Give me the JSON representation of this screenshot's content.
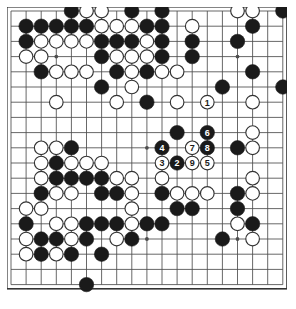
{
  "app": {
    "title": "Go Game Record Diagram",
    "description": "19x19 Go board position diagram with numbered move sequence 1-9"
  },
  "board": {
    "size": 19,
    "origin_x": 11,
    "origin_y": 11,
    "spacing_x": 15.1,
    "spacing_y": 15.2,
    "line_color": "#4d4d4d",
    "border_color": "#333333",
    "background_color": "#ffffff",
    "black_color": "#1a1a1a",
    "white_color": "#ffffff",
    "white_outline_color": "#333333",
    "stone_radius": 7.2,
    "star_points": [
      {
        "col": 3,
        "row": 3
      },
      {
        "col": 9,
        "row": 3
      },
      {
        "col": 15,
        "row": 3
      },
      {
        "col": 3,
        "row": 9
      },
      {
        "col": 9,
        "row": 9
      },
      {
        "col": 15,
        "row": 9
      },
      {
        "col": 3,
        "row": 15
      },
      {
        "col": 9,
        "row": 15
      },
      {
        "col": 15,
        "row": 15
      }
    ]
  },
  "stones": {
    "black": [
      {
        "col": 4,
        "row": 0
      },
      {
        "col": 8,
        "row": 0
      },
      {
        "col": 10,
        "row": 0
      },
      {
        "col": 18,
        "row": 0
      },
      {
        "col": 1,
        "row": 1
      },
      {
        "col": 2,
        "row": 1
      },
      {
        "col": 3,
        "row": 1
      },
      {
        "col": 4,
        "row": 1
      },
      {
        "col": 5,
        "row": 1
      },
      {
        "col": 9,
        "row": 1
      },
      {
        "col": 10,
        "row": 1
      },
      {
        "col": 16,
        "row": 1
      },
      {
        "col": 1,
        "row": 2
      },
      {
        "col": 6,
        "row": 2
      },
      {
        "col": 7,
        "row": 2
      },
      {
        "col": 8,
        "row": 2
      },
      {
        "col": 10,
        "row": 2
      },
      {
        "col": 12,
        "row": 2
      },
      {
        "col": 15,
        "row": 2
      },
      {
        "col": 6,
        "row": 3
      },
      {
        "col": 10,
        "row": 3
      },
      {
        "col": 12,
        "row": 3
      },
      {
        "col": 2,
        "row": 4
      },
      {
        "col": 7,
        "row": 4
      },
      {
        "col": 9,
        "row": 4
      },
      {
        "col": 16,
        "row": 4
      },
      {
        "col": 6,
        "row": 5
      },
      {
        "col": 14,
        "row": 5
      },
      {
        "col": 18,
        "row": 5
      },
      {
        "col": 9,
        "row": 6
      },
      {
        "col": 11,
        "row": 8
      },
      {
        "col": 13,
        "row": 8
      },
      {
        "col": 4,
        "row": 9
      },
      {
        "col": 13,
        "row": 9
      },
      {
        "col": 15,
        "row": 9
      },
      {
        "col": 3,
        "row": 10
      },
      {
        "col": 3,
        "row": 11
      },
      {
        "col": 4,
        "row": 11
      },
      {
        "col": 5,
        "row": 11
      },
      {
        "col": 6,
        "row": 11
      },
      {
        "col": 2,
        "row": 12
      },
      {
        "col": 6,
        "row": 12
      },
      {
        "col": 7,
        "row": 12
      },
      {
        "col": 10,
        "row": 12
      },
      {
        "col": 15,
        "row": 12
      },
      {
        "col": 11,
        "row": 13
      },
      {
        "col": 12,
        "row": 13
      },
      {
        "col": 15,
        "row": 13
      },
      {
        "col": 1,
        "row": 14
      },
      {
        "col": 5,
        "row": 14
      },
      {
        "col": 6,
        "row": 14
      },
      {
        "col": 7,
        "row": 14
      },
      {
        "col": 9,
        "row": 14
      },
      {
        "col": 10,
        "row": 14
      },
      {
        "col": 16,
        "row": 14
      },
      {
        "col": 2,
        "row": 15
      },
      {
        "col": 3,
        "row": 15
      },
      {
        "col": 5,
        "row": 15
      },
      {
        "col": 8,
        "row": 15
      },
      {
        "col": 14,
        "row": 15
      },
      {
        "col": 2,
        "row": 16
      },
      {
        "col": 4,
        "row": 16
      },
      {
        "col": 6,
        "row": 16
      },
      {
        "col": 5,
        "row": 18
      }
    ],
    "white": [
      {
        "col": 5,
        "row": 0
      },
      {
        "col": 6,
        "row": 0
      },
      {
        "col": 15,
        "row": 0
      },
      {
        "col": 16,
        "row": 0
      },
      {
        "col": 6,
        "row": 1
      },
      {
        "col": 7,
        "row": 1
      },
      {
        "col": 8,
        "row": 1
      },
      {
        "col": 12,
        "row": 1
      },
      {
        "col": 2,
        "row": 2
      },
      {
        "col": 3,
        "row": 2
      },
      {
        "col": 4,
        "row": 2
      },
      {
        "col": 5,
        "row": 2
      },
      {
        "col": 9,
        "row": 2
      },
      {
        "col": 1,
        "row": 3
      },
      {
        "col": 2,
        "row": 3
      },
      {
        "col": 7,
        "row": 3
      },
      {
        "col": 8,
        "row": 3
      },
      {
        "col": 9,
        "row": 3
      },
      {
        "col": 3,
        "row": 4
      },
      {
        "col": 4,
        "row": 4
      },
      {
        "col": 5,
        "row": 4
      },
      {
        "col": 8,
        "row": 4
      },
      {
        "col": 10,
        "row": 4
      },
      {
        "col": 11,
        "row": 4
      },
      {
        "col": 8,
        "row": 5
      },
      {
        "col": 3,
        "row": 6
      },
      {
        "col": 7,
        "row": 6
      },
      {
        "col": 11,
        "row": 6
      },
      {
        "col": 16,
        "row": 6
      },
      {
        "col": 16,
        "row": 8
      },
      {
        "col": 2,
        "row": 9
      },
      {
        "col": 3,
        "row": 9
      },
      {
        "col": 16,
        "row": 9
      },
      {
        "col": 2,
        "row": 10
      },
      {
        "col": 4,
        "row": 10
      },
      {
        "col": 5,
        "row": 10
      },
      {
        "col": 6,
        "row": 10
      },
      {
        "col": 2,
        "row": 11
      },
      {
        "col": 7,
        "row": 11
      },
      {
        "col": 8,
        "row": 11
      },
      {
        "col": 10,
        "row": 11
      },
      {
        "col": 16,
        "row": 11
      },
      {
        "col": 3,
        "row": 12
      },
      {
        "col": 4,
        "row": 12
      },
      {
        "col": 8,
        "row": 12
      },
      {
        "col": 11,
        "row": 12
      },
      {
        "col": 12,
        "row": 12
      },
      {
        "col": 13,
        "row": 12
      },
      {
        "col": 16,
        "row": 12
      },
      {
        "col": 1,
        "row": 13
      },
      {
        "col": 2,
        "row": 13
      },
      {
        "col": 8,
        "row": 13
      },
      {
        "col": 3,
        "row": 14
      },
      {
        "col": 4,
        "row": 14
      },
      {
        "col": 8,
        "row": 14
      },
      {
        "col": 15,
        "row": 14
      },
      {
        "col": 1,
        "row": 15
      },
      {
        "col": 4,
        "row": 15
      },
      {
        "col": 7,
        "row": 15
      },
      {
        "col": 16,
        "row": 15
      },
      {
        "col": 1,
        "row": 16
      },
      {
        "col": 3,
        "row": 16
      }
    ]
  },
  "move_sequence": [
    {
      "number": "1",
      "col": 13,
      "row": 6,
      "color": "white"
    },
    {
      "number": "2",
      "col": 11,
      "row": 10,
      "color": "black"
    },
    {
      "number": "3",
      "col": 10,
      "row": 10,
      "color": "white"
    },
    {
      "number": "4",
      "col": 10,
      "row": 9,
      "color": "black"
    },
    {
      "number": "5",
      "col": 13,
      "row": 10,
      "color": "white"
    },
    {
      "number": "6",
      "col": 13,
      "row": 8,
      "color": "black"
    },
    {
      "number": "7",
      "col": 12,
      "row": 9,
      "color": "white"
    },
    {
      "number": "8",
      "col": 13,
      "row": 9,
      "color": "black"
    },
    {
      "number": "9",
      "col": 12,
      "row": 10,
      "color": "white"
    }
  ],
  "legend": {
    "black_label": "Black",
    "white_label": "White",
    "move_label": "Move"
  }
}
